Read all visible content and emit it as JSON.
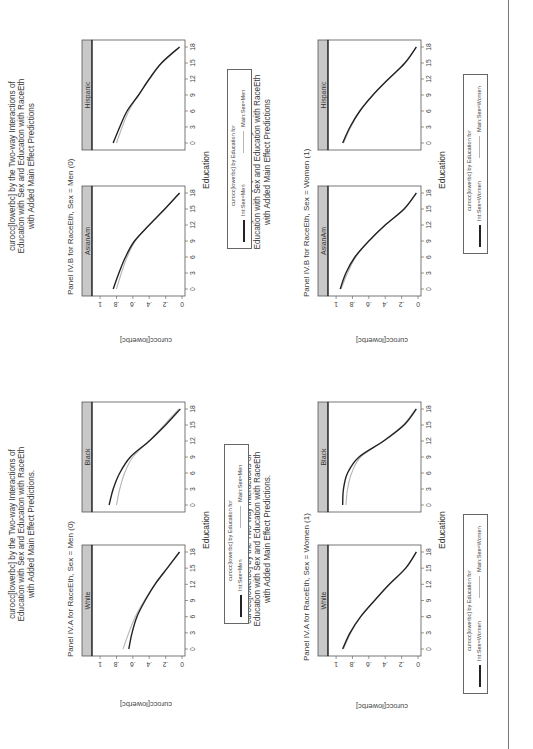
{
  "page": {
    "orientation": "rotated 90 degrees counter-clockwise",
    "divider_color": "#777777"
  },
  "figures": [
    {
      "id": "men",
      "panel_label": "Panel IV.A for RaceEth, Sex = Men (0)",
      "title_lines": [
        "curocc[lowerbc] by the Two-way Interactions of",
        "Education with Sex and Education with RaceEth",
        "with Added Main Effect Predictions."
      ],
      "ylabel": "curocc[lowerbc]",
      "xlabel": "Education",
      "legend": {
        "title": "curocc[lowerbc] by Education for",
        "items": [
          {
            "label": "Int:Sex=Men",
            "style": "dark"
          },
          {
            "label": "Main:Sex=Men",
            "style": "light"
          }
        ]
      }
    },
    {
      "id": "men-b",
      "panel_label": "Panel IV.B for RaceEth, Sex = Men (0)",
      "title_lines": [
        "curocc[lowerbc] by the Two-way Interactions of",
        "Education with Sex and Education with RaceEth",
        "with Added Main Effect Predictions"
      ],
      "ylabel": "curocc[lowerbc]",
      "xlabel": "Education",
      "legend": {
        "title": "curocc[lowerbc] by Education for",
        "items": [
          {
            "label": "Int:Sex=Men",
            "style": "dark"
          },
          {
            "label": "Main:Sex=Men",
            "style": "light"
          }
        ]
      }
    },
    {
      "id": "women",
      "panel_label": "Panel IV.A for RaceEth,  Sex = Women (1)",
      "title_lines": [
        "curocc[lowerbc] by the Two-way Interactions of",
        "Education with Sex and Education with RaceEth",
        "with Added Main Effect Predictions."
      ],
      "ylabel": "curocc[lowerbc]",
      "xlabel": "Education",
      "legend": {
        "title": "curocc[lowerbc] by Education for",
        "items": [
          {
            "label": "Int:Sex=Women",
            "style": "dark"
          },
          {
            "label": "Main:Sex=Women",
            "style": "light"
          }
        ]
      }
    },
    {
      "id": "women-b",
      "panel_label": "Panel IV.B for RaceEth, Sex = Women (1)",
      "title_lines": [
        "curocc[lowerbc] by the Two-way Interactions of",
        "Education with Sex and Education with RaceEth",
        "with Added Main Effect Predictions"
      ],
      "ylabel": "curocc[lowerbc]",
      "xlabel": "Education",
      "legend": {
        "title": "curocc[lowerbc] by Education for",
        "items": [
          {
            "label": "Int:Sex=Women",
            "style": "dark"
          },
          {
            "label": "Main:Sex=Women",
            "style": "light"
          }
        ]
      }
    }
  ],
  "axes": {
    "x_ticks": [
      "0",
      "3",
      "6",
      "9",
      "12",
      "15",
      "18"
    ],
    "y_ticks": [
      "0",
      ".2",
      ".4",
      ".6",
      ".8",
      "1"
    ]
  },
  "colors": {
    "int_line": "#222222",
    "main_line": "#b5b5b5",
    "strip_bg": "#c8c8c8",
    "frame": "#555555"
  },
  "chart_data": [
    {
      "type": "line",
      "title": "Panel IV.A for RaceEth, Sex = Men (0)",
      "xlabel": "Education",
      "ylabel": "curocc[lowerbc]",
      "xlim": [
        0,
        18
      ],
      "ylim": [
        0,
        1
      ],
      "x": [
        0,
        3,
        6,
        9,
        12,
        15,
        18
      ],
      "panels": [
        {
          "name": "White",
          "series": [
            {
              "name": "Int:Sex=Men",
              "values": [
                0.65,
                0.61,
                0.55,
                0.45,
                0.33,
                0.18,
                0.03
              ]
            },
            {
              "name": "Main:Sex=Men",
              "values": [
                0.72,
                0.65,
                0.57,
                0.46,
                0.33,
                0.18,
                0.03
              ]
            }
          ]
        },
        {
          "name": "Black",
          "series": [
            {
              "name": "Int:Sex=Men",
              "values": [
                0.89,
                0.84,
                0.76,
                0.63,
                0.4,
                0.2,
                0.02
              ]
            },
            {
              "name": "Main:Sex=Men",
              "values": [
                0.8,
                0.76,
                0.7,
                0.6,
                0.4,
                0.22,
                0.04
              ]
            }
          ]
        }
      ]
    },
    {
      "type": "line",
      "title": "Panel IV.B for RaceEth, Sex = Men (0)",
      "xlabel": "Education",
      "ylabel": "curocc[lowerbc]",
      "xlim": [
        0,
        18
      ],
      "ylim": [
        0,
        1
      ],
      "x": [
        0,
        3,
        6,
        9,
        12,
        15,
        18
      ],
      "panels": [
        {
          "name": "AsianAm",
          "series": [
            {
              "name": "Int:Sex=Men",
              "values": [
                0.84,
                0.77,
                0.69,
                0.58,
                0.4,
                0.21,
                0.03
              ]
            },
            {
              "name": "Main:Sex=Men",
              "values": [
                0.8,
                0.74,
                0.67,
                0.57,
                0.4,
                0.21,
                0.03
              ]
            }
          ]
        },
        {
          "name": "Hispanic",
          "series": [
            {
              "name": "Int:Sex=Men",
              "values": [
                0.84,
                0.76,
                0.67,
                0.53,
                0.4,
                0.25,
                0.03
              ]
            },
            {
              "name": "Main:Sex=Men",
              "values": [
                0.8,
                0.73,
                0.65,
                0.53,
                0.4,
                0.25,
                0.03
              ]
            }
          ]
        }
      ]
    },
    {
      "type": "line",
      "title": "Panel IV.A for RaceEth, Sex = Women (1)",
      "xlabel": "Education",
      "ylabel": "curocc[lowerbc]",
      "xlim": [
        0,
        18
      ],
      "ylim": [
        0,
        1
      ],
      "x": [
        0,
        3,
        6,
        9,
        12,
        15,
        18
      ],
      "panels": [
        {
          "name": "White",
          "series": [
            {
              "name": "Int:Sex=Women",
              "values": [
                0.92,
                0.83,
                0.7,
                0.53,
                0.35,
                0.15,
                0.02
              ]
            },
            {
              "name": "Main:Sex=Women",
              "values": [
                0.91,
                0.82,
                0.7,
                0.53,
                0.35,
                0.15,
                0.02
              ]
            }
          ]
        },
        {
          "name": "Black",
          "series": [
            {
              "name": "Int:Sex=Women",
              "values": [
                0.92,
                0.91,
                0.86,
                0.72,
                0.42,
                0.17,
                0.02
              ]
            },
            {
              "name": "Main:Sex=Women",
              "values": [
                0.88,
                0.86,
                0.81,
                0.7,
                0.42,
                0.18,
                0.03
              ]
            }
          ]
        }
      ]
    },
    {
      "type": "line",
      "title": "Panel IV.B for RaceEth, Sex = Women (1)",
      "xlabel": "Education",
      "ylabel": "curocc[lowerbc]",
      "xlim": [
        0,
        18
      ],
      "ylim": [
        0,
        1
      ],
      "x": [
        0,
        3,
        6,
        9,
        12,
        15,
        18
      ],
      "panels": [
        {
          "name": "AsianAm",
          "series": [
            {
              "name": "Int:Sex=Women",
              "values": [
                0.95,
                0.88,
                0.77,
                0.6,
                0.4,
                0.17,
                0.02
              ]
            },
            {
              "name": "Main:Sex=Women",
              "values": [
                0.94,
                0.86,
                0.76,
                0.6,
                0.4,
                0.17,
                0.02
              ]
            }
          ]
        },
        {
          "name": "Hispanic",
          "series": [
            {
              "name": "Int:Sex=Women",
              "values": [
                0.92,
                0.83,
                0.71,
                0.55,
                0.36,
                0.16,
                0.02
              ]
            },
            {
              "name": "Main:Sex=Women",
              "values": [
                0.91,
                0.82,
                0.71,
                0.55,
                0.36,
                0.16,
                0.02
              ]
            }
          ]
        }
      ]
    }
  ]
}
